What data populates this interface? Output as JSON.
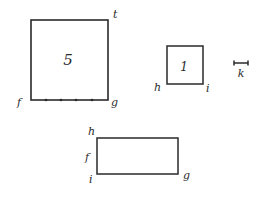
{
  "diagram": {
    "big_square": {
      "number": "5",
      "labels": {
        "top_right": "t",
        "bottom_left": "f",
        "bottom_right": "g"
      },
      "tick_count": 4
    },
    "small_square": {
      "number": "1",
      "labels": {
        "bottom_left": "h",
        "bottom_right": "i"
      }
    },
    "scale_bar": {
      "label": "k"
    },
    "rectangle": {
      "labels": {
        "top_left": "h",
        "mid_left": "f",
        "bottom_left": "i",
        "bottom_right": "g"
      }
    },
    "colors": {
      "stroke": "#2a2a2a",
      "background": "#ffffff"
    }
  }
}
